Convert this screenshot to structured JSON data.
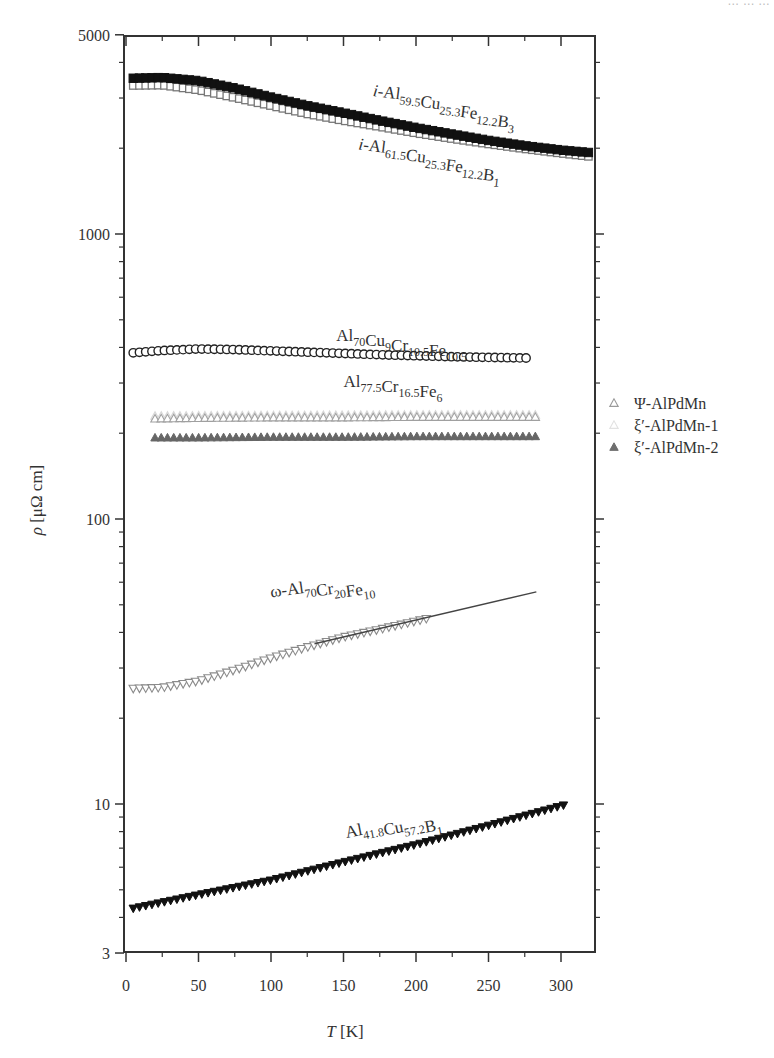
{
  "page": {
    "header_partial_text": "… … …"
  },
  "chart_data": {
    "type": "scatter",
    "title": "",
    "xlabel": "T [K]",
    "xlabel_italic_part": "T",
    "xlabel_unit": "[K]",
    "ylabel": "ρ [μΩ cm]",
    "ylabel_italic_part": "ρ",
    "ylabel_unit": "[μΩ cm]",
    "xlim": [
      -2,
      325
    ],
    "ylim": [
      3,
      5000
    ],
    "yscale": "log",
    "grid": false,
    "x_ticks": [
      0,
      50,
      100,
      150,
      200,
      250,
      300
    ],
    "x_tick_labels": [
      "0",
      "50",
      "100",
      "150",
      "200",
      "250",
      "300"
    ],
    "x_minor_ticks": [
      25,
      75,
      125,
      175,
      225,
      275
    ],
    "y_ticks": [
      3,
      10,
      100,
      1000,
      5000
    ],
    "y_tick_labels": [
      "3",
      "10",
      "100",
      "1000",
      "5000"
    ],
    "legend": {
      "placement": "outside-right",
      "entries": [
        {
          "label": "Ψ-AlPdMn",
          "marker": "triangle-up-open",
          "color": "#9a9a9a"
        },
        {
          "label": "ξ′-AlPdMn-1",
          "marker": "triangle-up-open",
          "color": "#e2e2e2"
        },
        {
          "label": "ξ′-AlPdMn-2",
          "marker": "triangle-up-filled",
          "color": "#6e6e6e"
        }
      ]
    },
    "annotations": [
      {
        "id": "b3",
        "parts": [
          [
            "i-",
            "italic"
          ],
          [
            "Al",
            "n"
          ],
          [
            "59.5",
            "sub"
          ],
          [
            "Cu",
            "n"
          ],
          [
            "25.3",
            "sub"
          ],
          [
            "Fe",
            "n"
          ],
          [
            "12.2",
            "sub"
          ],
          [
            "B",
            "n"
          ],
          [
            "3",
            "sub"
          ]
        ],
        "x": 170,
        "y": 3050,
        "angle": 7
      },
      {
        "id": "b1",
        "parts": [
          [
            "i-",
            "italic"
          ],
          [
            "Al",
            "n"
          ],
          [
            "61.5",
            "sub"
          ],
          [
            "Cu",
            "n"
          ],
          [
            "25.3",
            "sub"
          ],
          [
            "Fe",
            "n"
          ],
          [
            "12.2",
            "sub"
          ],
          [
            "B",
            "n"
          ],
          [
            "1",
            "sub"
          ]
        ],
        "x": 160,
        "y": 1980,
        "angle": 7
      },
      {
        "id": "cucrfe",
        "parts": [
          [
            "Al",
            "n"
          ],
          [
            "70",
            "sub"
          ],
          [
            "Cu",
            "n"
          ],
          [
            "9",
            "sub"
          ],
          [
            "Cr",
            "n"
          ],
          [
            "10.5",
            "sub"
          ],
          [
            "Fe",
            "n"
          ],
          [
            "10.5",
            "sub"
          ]
        ],
        "x": 145,
        "y": 420,
        "angle": 0
      },
      {
        "id": "crfe",
        "parts": [
          [
            "Al",
            "n"
          ],
          [
            "77.5",
            "sub"
          ],
          [
            "Cr",
            "n"
          ],
          [
            "16.5",
            "sub"
          ],
          [
            "Fe",
            "n"
          ],
          [
            "6",
            "sub"
          ]
        ],
        "x": 150,
        "y": 290,
        "angle": 0
      },
      {
        "id": "omega",
        "parts": [
          [
            "ω-Al",
            "n"
          ],
          [
            "70",
            "sub"
          ],
          [
            "Cr",
            "n"
          ],
          [
            "20",
            "sub"
          ],
          [
            "Fe",
            "n"
          ],
          [
            "10",
            "sub"
          ]
        ],
        "x": 100,
        "y": 53,
        "angle": -8
      },
      {
        "id": "alcub",
        "parts": [
          [
            "Al",
            "n"
          ],
          [
            "41.8",
            "sub"
          ],
          [
            "Cu",
            "n"
          ],
          [
            "57.2",
            "sub"
          ],
          [
            "B",
            "n"
          ],
          [
            "1",
            "sub"
          ]
        ],
        "x": 152,
        "y": 7.6,
        "angle": -11
      }
    ],
    "series": [
      {
        "name": "i-Al59.5Cu25.3Fe12.2B3",
        "marker": "square-filled",
        "color": "#111111",
        "x": [
          5,
          25,
          50,
          75,
          100,
          125,
          150,
          175,
          200,
          225,
          250,
          275,
          300,
          320
        ],
        "y": [
          3520,
          3540,
          3450,
          3250,
          3020,
          2820,
          2660,
          2500,
          2360,
          2240,
          2130,
          2040,
          1970,
          1930
        ]
      },
      {
        "name": "i-Al61.5Cu25.3Fe12.2B1",
        "marker": "square-open",
        "color": "#777777",
        "x": [
          5,
          25,
          50,
          75,
          100,
          125,
          150,
          175,
          200,
          225,
          250,
          275,
          300,
          320
        ],
        "y": [
          3320,
          3330,
          3200,
          3010,
          2820,
          2640,
          2500,
          2380,
          2260,
          2160,
          2070,
          1990,
          1920,
          1870
        ]
      },
      {
        "name": "Al70Cu9Cr10.5Fe10.5",
        "marker": "circle-open",
        "color": "#222222",
        "x": [
          5,
          25,
          50,
          75,
          100,
          125,
          150,
          175,
          200,
          225,
          250,
          280
        ],
        "y": [
          383,
          390,
          395,
          393,
          389,
          385,
          381,
          377,
          374,
          371,
          369,
          367
        ]
      },
      {
        "name": "Ψ-AlPdMn",
        "marker": "triangle-up-open",
        "color": "#a0a0a0",
        "x": [
          20,
          50,
          100,
          150,
          200,
          250,
          285
        ],
        "y": [
          225,
          226,
          227,
          227,
          228,
          228,
          228
        ]
      },
      {
        "name": "ξ′-AlPdMn-1",
        "marker": "triangle-up-open",
        "color": "#d8d8d8",
        "x": [
          20,
          100,
          200,
          285
        ],
        "y": [
          230,
          231,
          232,
          232
        ]
      },
      {
        "name": "ξ′-AlPdMn-2",
        "marker": "triangle-up-filled",
        "color": "#666666",
        "x": [
          20,
          50,
          100,
          150,
          200,
          250,
          285
        ],
        "y": [
          193,
          193,
          194,
          194,
          195,
          195,
          195
        ]
      },
      {
        "name": "ω-Al70Cr20Fe10",
        "marker": "triangle-down-open",
        "color": "#8a8a8a",
        "x": [
          5,
          25,
          50,
          75,
          100,
          125,
          150,
          175,
          210
        ],
        "y": [
          25.4,
          25.6,
          27.0,
          29.5,
          32.5,
          35.5,
          38.5,
          41.0,
          45.0
        ]
      },
      {
        "name": "ω-Al70Cr20Fe10 fit",
        "marker": "line",
        "color": "#444444",
        "x": [
          130,
          283
        ],
        "y": [
          36.5,
          55.5
        ]
      },
      {
        "name": "Al41.8Cu57.2B1",
        "marker": "triangle-down-filled",
        "color": "#111111",
        "x": [
          5,
          50,
          100,
          150,
          200,
          250,
          305
        ],
        "y": [
          4.3,
          4.8,
          5.4,
          6.25,
          7.2,
          8.4,
          10.0
        ]
      }
    ]
  }
}
